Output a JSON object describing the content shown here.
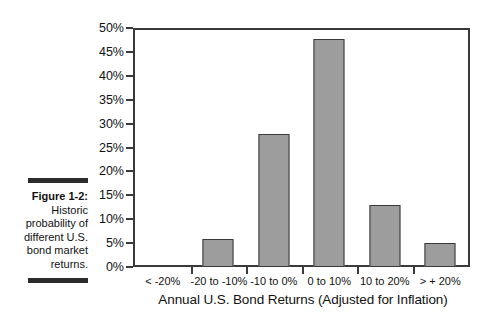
{
  "figure": {
    "label": "Figure 1-2:",
    "caption": "Historic probability of different U.S. bond market returns."
  },
  "chart_data": {
    "type": "bar",
    "title": "",
    "xlabel": "Annual U.S. Bond Returns (Adjusted for Inflation)",
    "ylabel": "Historic Probability",
    "categories": [
      "< -20%",
      "-20 to -10%",
      "-10 to 0%",
      "0 to 10%",
      "10 to 20%",
      "> + 20%"
    ],
    "values": [
      0,
      6,
      28,
      48,
      13,
      5
    ],
    "ylim": [
      0,
      50
    ],
    "ytick_values": [
      0,
      5,
      10,
      15,
      20,
      25,
      30,
      35,
      40,
      45,
      50
    ],
    "ytick_labels": [
      "0%",
      "5%",
      "10%",
      "15%",
      "20%",
      "25%",
      "30%",
      "35%",
      "40%",
      "45%",
      "50%"
    ],
    "grid": false,
    "legend": false,
    "bar_color": "#9d9d9d",
    "bar_edge_color": "#3a3a3a",
    "axis_color": "#3a3a3a",
    "background": "#ffffff"
  }
}
